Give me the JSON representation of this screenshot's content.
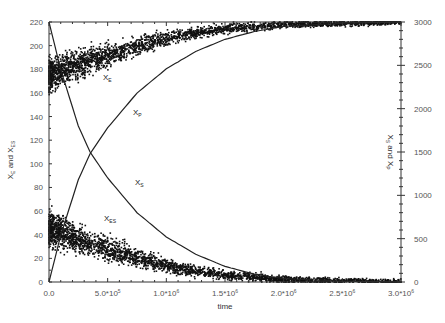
{
  "chart_data": {
    "type": "scatter",
    "title": "",
    "xlabel": "time",
    "ylabel_left": "X_E and X_ES",
    "ylabel_right": "X_S and X_P",
    "xlim": [
      0,
      3000000
    ],
    "ylim_left": [
      0,
      220
    ],
    "ylim_right": [
      0,
      3000
    ],
    "grid": false,
    "legend": "inline curve labels",
    "x_ticks": [
      {
        "value": 0,
        "label": "0.0"
      },
      {
        "value": 500000,
        "label": "5.0*10",
        "exp": "5"
      },
      {
        "value": 1000000,
        "label": "1.0*10",
        "exp": "6"
      },
      {
        "value": 1500000,
        "label": "1.5*10",
        "exp": "6"
      },
      {
        "value": 2000000,
        "label": "2.0*10",
        "exp": "6"
      },
      {
        "value": 2500000,
        "label": "2.5*10",
        "exp": "6"
      },
      {
        "value": 3000000,
        "label": "3.0*10",
        "exp": "6"
      }
    ],
    "y_ticks_left": [
      0,
      20,
      40,
      60,
      80,
      100,
      120,
      140,
      160,
      180,
      200,
      220
    ],
    "y_ticks_right": [
      0,
      500,
      1000,
      1500,
      2000,
      2500,
      3000
    ],
    "series": [
      {
        "name": "X_E",
        "axis": "left",
        "style": "scatter",
        "label": "X",
        "sub": "E",
        "x": [
          0,
          100000,
          250000,
          500000,
          750000,
          1000000,
          1250000,
          1500000,
          1750000,
          2000000,
          2500000,
          3000000
        ],
        "y": [
          175,
          178,
          184,
          192,
          199,
          206,
          211,
          214,
          216,
          218,
          219,
          220
        ]
      },
      {
        "name": "X_ES",
        "axis": "left",
        "style": "scatter",
        "label": "X",
        "sub": "ES",
        "x": [
          0,
          100000,
          250000,
          500000,
          750000,
          1000000,
          1250000,
          1500000,
          1750000,
          2000000,
          2500000,
          3000000
        ],
        "y": [
          45,
          42,
          36,
          28,
          21,
          14,
          9,
          6,
          4,
          2,
          1,
          0
        ]
      },
      {
        "name": "X_S",
        "axis": "right",
        "style": "line",
        "label": "X",
        "sub": "S",
        "x": [
          0,
          100000,
          250000,
          350000,
          500000,
          750000,
          1000000,
          1250000,
          1500000,
          1750000,
          2000000,
          2500000,
          3000000
        ],
        "y": [
          3000,
          2450,
          1800,
          1500,
          1200,
          800,
          520,
          320,
          180,
          90,
          40,
          10,
          0
        ]
      },
      {
        "name": "X_P",
        "axis": "right",
        "style": "line",
        "label": "X",
        "sub": "P",
        "x": [
          0,
          100000,
          250000,
          350000,
          500000,
          750000,
          1000000,
          1250000,
          1500000,
          1750000,
          2000000,
          2500000,
          3000000
        ],
        "y": [
          0,
          540,
          1180,
          1480,
          1780,
          2180,
          2460,
          2660,
          2800,
          2890,
          2950,
          2985,
          3000
        ]
      }
    ],
    "curve_label_positions": {
      "X_E": [
        103,
        80
      ],
      "X_P": [
        133,
        115
      ],
      "X_S": [
        135,
        185
      ],
      "X_ES": [
        104,
        221
      ]
    }
  }
}
